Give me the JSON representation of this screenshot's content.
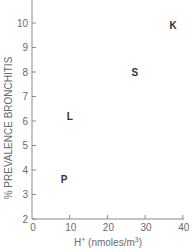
{
  "chart_data": {
    "type": "scatter",
    "title": "",
    "xlabel": "H+ (nmoles/m3)",
    "xlabel_parts": {
      "base": "H",
      "sup1": "+",
      "mid": " (nmoles/m",
      "sup2": "3",
      "end": ")"
    },
    "ylabel": "% PREVALENCE BRONCHITIS",
    "xlim": [
      0,
      40
    ],
    "ylim": [
      2,
      10.9
    ],
    "xticks": [
      0,
      10,
      20,
      30,
      40
    ],
    "yticks": [
      2,
      3,
      4,
      5,
      6,
      7,
      8,
      9,
      10
    ],
    "grid": false,
    "legend": null,
    "marker_style": "letter labels",
    "points": [
      {
        "label": "P",
        "x": 8.5,
        "y": 3.6
      },
      {
        "label": "L",
        "x": 10,
        "y": 6.2
      },
      {
        "label": "S",
        "x": 27.3,
        "y": 8.0
      },
      {
        "label": "K",
        "x": 37.4,
        "y": 9.9
      }
    ]
  },
  "colors": {
    "axis": "#8a8a8a",
    "text": "#6a6a6a",
    "point_label": "#333333",
    "background": "#ffffff"
  }
}
